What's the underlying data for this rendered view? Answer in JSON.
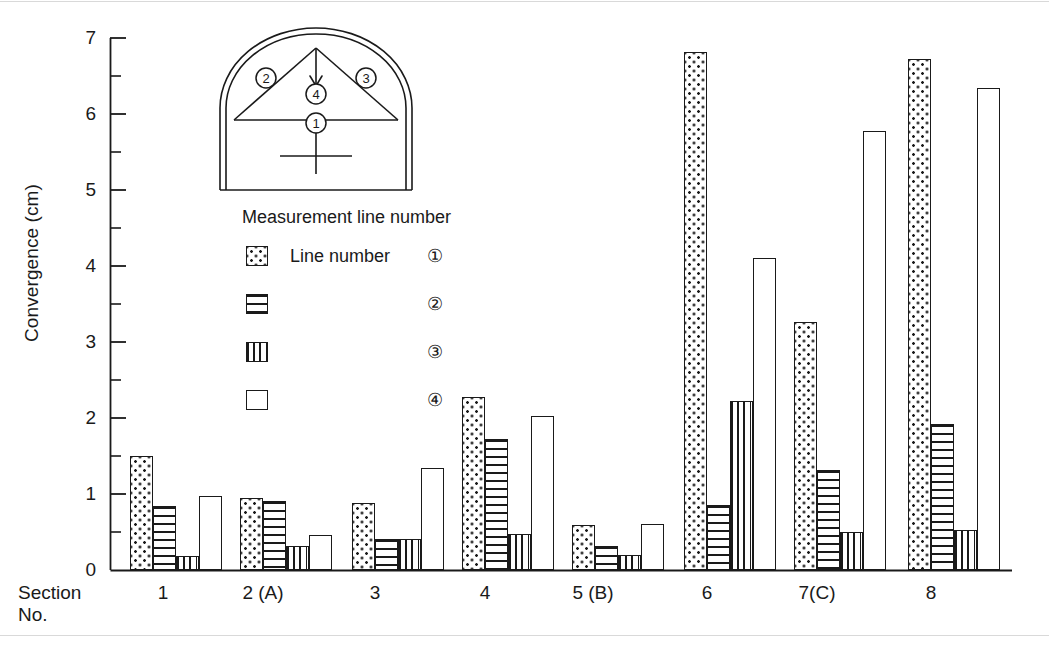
{
  "chart_data": {
    "type": "bar",
    "title": "",
    "xlabel": "Section No.",
    "ylabel": "Convergence (cm)",
    "categories": [
      "1",
      "2 (A)",
      "3",
      "4",
      "5 (B)",
      "6",
      "7(C)",
      "8"
    ],
    "series": [
      {
        "name": "Line number ①",
        "pattern": "dots",
        "values": [
          1.5,
          0.95,
          0.88,
          2.28,
          0.59,
          6.82,
          3.26,
          6.72
        ]
      },
      {
        "name": "②",
        "pattern": "hlines",
        "values": [
          0.84,
          0.91,
          0.41,
          1.73,
          0.31,
          0.86,
          1.31,
          1.92
        ]
      },
      {
        "name": "③",
        "pattern": "vlines",
        "values": [
          0.19,
          0.31,
          0.41,
          0.48,
          0.2,
          2.22,
          0.5,
          0.53
        ]
      },
      {
        "name": "④",
        "pattern": "blank",
        "values": [
          0.97,
          0.46,
          1.34,
          2.03,
          0.61,
          4.1,
          5.77,
          6.34
        ]
      }
    ],
    "ylim": [
      0,
      7
    ],
    "yticks": [
      0,
      1,
      2,
      3,
      4,
      5,
      6,
      7
    ],
    "ytick_labels": [
      "0",
      "1",
      "2",
      "3",
      "4",
      "5",
      "6",
      "7"
    ],
    "yminor_step": 0.5,
    "grid": false,
    "legend_position": "upper-left-inset"
  },
  "axis": {
    "ylabel": "Convergence (cm)",
    "xlabel_line1": "Section",
    "xlabel_line2": "No."
  },
  "legend": {
    "title": "Measurement line number",
    "entries": [
      {
        "pattern": "dots",
        "text": "Line number",
        "marker": "①"
      },
      {
        "pattern": "hlines",
        "text": "",
        "marker": "②"
      },
      {
        "pattern": "vlines",
        "text": "",
        "marker": "③"
      },
      {
        "pattern": "blank",
        "text": "",
        "marker": "④"
      }
    ]
  },
  "diagram": {
    "name": "tunnel-cross-section",
    "markers": [
      "①",
      "②",
      "③",
      "④"
    ]
  },
  "colors": {
    "ink": "#1a1a1a",
    "background": "#ffffff"
  }
}
